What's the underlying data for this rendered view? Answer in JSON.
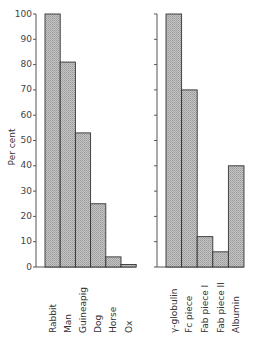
{
  "chart_data": [
    {
      "type": "bar",
      "title": "",
      "xlabel": "",
      "ylabel": "Per cent",
      "ylim": [
        0,
        100
      ],
      "yticks": [
        0,
        10,
        20,
        30,
        40,
        50,
        60,
        70,
        80,
        90,
        100
      ],
      "grid": false,
      "categories": [
        "Rabbit",
        "Man",
        "Guineapig",
        "Dog",
        "Horse",
        "Ox"
      ],
      "values": [
        100,
        81,
        53,
        25,
        4,
        1
      ]
    },
    {
      "type": "bar",
      "title": "",
      "xlabel": "",
      "ylabel": "",
      "ylim": [
        0,
        100
      ],
      "yticks": [
        0,
        10,
        20,
        30,
        40,
        50,
        60,
        70,
        80,
        90,
        100
      ],
      "ytick_labels_shown": false,
      "grid": false,
      "categories": [
        "γ-globulin",
        "Fc piece",
        "Fab piece I",
        "Fab piece II",
        "Albumin"
      ],
      "values": [
        100,
        70,
        12,
        6,
        40
      ]
    }
  ],
  "style": {
    "bar_fill": "#b8b8b8",
    "bar_stroke": "#333333",
    "axis_color": "#555555"
  }
}
